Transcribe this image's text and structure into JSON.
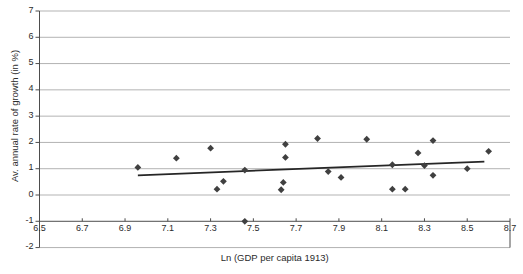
{
  "chart_data": {
    "type": "scatter",
    "title": "",
    "xlabel": "Ln (GDP per capita 1913)",
    "ylabel": "Av. annual rate of growth (in %)",
    "xlim": [
      6.5,
      8.7
    ],
    "ylim": [
      -2,
      7
    ],
    "plot_ylim": [
      -1,
      7
    ],
    "grid": true,
    "grid_axis": "y",
    "legend": null,
    "xticks": [
      "6.5",
      "6.7",
      "6.9",
      "7.1",
      "7.3",
      "7.5",
      "7.7",
      "7.9",
      "8.1",
      "8.3",
      "8.5",
      "8.7"
    ],
    "xtick_values": [
      6.5,
      6.7,
      6.9,
      7.1,
      7.3,
      7.5,
      7.7,
      7.9,
      8.1,
      8.3,
      8.5,
      8.7
    ],
    "yticks": [
      "7",
      "6",
      "5",
      "4",
      "3",
      "2",
      "1",
      "0",
      "-1",
      "-2"
    ],
    "ytick_values": [
      7,
      6,
      5,
      4,
      3,
      2,
      1,
      0,
      -1,
      -2
    ],
    "marker": "diamond",
    "marker_color": "#404040",
    "marker_size": 3.4,
    "points": [
      {
        "x": 6.96,
        "y": 1.05
      },
      {
        "x": 7.14,
        "y": 1.4
      },
      {
        "x": 7.3,
        "y": 1.78
      },
      {
        "x": 7.33,
        "y": 0.22
      },
      {
        "x": 7.36,
        "y": 0.52
      },
      {
        "x": 7.46,
        "y": 0.95
      },
      {
        "x": 7.46,
        "y": -1.0
      },
      {
        "x": 7.63,
        "y": 0.2
      },
      {
        "x": 7.64,
        "y": 0.48
      },
      {
        "x": 7.65,
        "y": 1.43
      },
      {
        "x": 7.65,
        "y": 1.93
      },
      {
        "x": 7.8,
        "y": 2.15
      },
      {
        "x": 7.85,
        "y": 0.89
      },
      {
        "x": 7.91,
        "y": 0.67
      },
      {
        "x": 8.03,
        "y": 2.12
      },
      {
        "x": 8.15,
        "y": 1.15
      },
      {
        "x": 8.15,
        "y": 0.22
      },
      {
        "x": 8.21,
        "y": 0.22
      },
      {
        "x": 8.27,
        "y": 1.6
      },
      {
        "x": 8.3,
        "y": 1.12
      },
      {
        "x": 8.34,
        "y": 2.07
      },
      {
        "x": 8.34,
        "y": 0.75
      },
      {
        "x": 8.5,
        "y": 1.0
      },
      {
        "x": 8.6,
        "y": 1.66
      }
    ],
    "trendline": {
      "x0": 6.96,
      "y0": 0.75,
      "x1": 8.58,
      "y1": 1.27,
      "color": "#262626",
      "width": 1.8
    },
    "colors": {
      "axis": "#4d4d4d",
      "grid": "#b3b3b3",
      "text": "#2b2b2b",
      "background": "#ffffff"
    }
  }
}
